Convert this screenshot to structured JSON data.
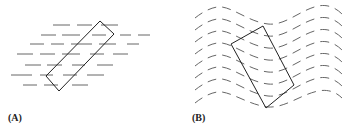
{
  "figure": {
    "panels": [
      {
        "id": "A",
        "label": "(A)",
        "description": "Rectangle tilted across straight parallel dashed lines",
        "line_style": "straight-dashed",
        "rectangle": [
          [
            100,
            21
          ],
          [
            114,
            34
          ],
          [
            59,
            91
          ],
          [
            46,
            76
          ]
        ]
      },
      {
        "id": "B",
        "label": "(B)",
        "description": "Rectangle tilted across wavy parallel dashed lines",
        "line_style": "wavy-dashed",
        "rectangle": [
          [
            263,
            26
          ],
          [
            294,
            85
          ],
          [
            266,
            108
          ],
          [
            231,
            44
          ]
        ]
      }
    ],
    "colors": {
      "lines": "#555555",
      "rectangle": "#222222",
      "background": "#ffffff"
    }
  }
}
